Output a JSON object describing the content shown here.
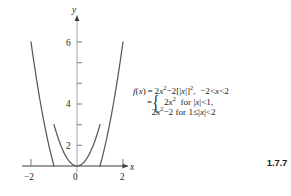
{
  "figure": {
    "number": "1.7.7",
    "axes": {
      "x_label": "x",
      "y_label": "y",
      "origin_label": "0",
      "x_ticks_labeled": [
        "-2",
        "2"
      ],
      "y_ticks_labeled": [
        "2",
        "4",
        "6"
      ]
    },
    "formula": {
      "line1": {
        "lhs": "f(x)",
        "eq": "=",
        "rhs_a": "2x",
        "rhs_a_exp": "2",
        "minus": "−2[[x]]",
        "minus_exp": "2",
        "comma": ",",
        "domain": "−2 < x < 2"
      },
      "line2": {
        "eq": "=",
        "brace": "{",
        "expr": "2x",
        "expr_exp": "2",
        "for": "for",
        "cond": "|x| < 1,"
      },
      "line3": {
        "expr": "2x",
        "expr_exp": "2",
        "expr_tail": "−2",
        "for": "for",
        "cond": "1 ≤ |x| < 2"
      }
    }
  },
  "chart_data": {
    "type": "line",
    "title": "",
    "xlabel": "x",
    "ylabel": "y",
    "xlim": [
      -2.45,
      2.45
    ],
    "ylim": [
      -0.6,
      6.9
    ],
    "xticks": [
      -2,
      -1,
      1,
      2
    ],
    "xtick_labels": [
      "-2",
      "",
      "",
      "2"
    ],
    "yticks": [
      1,
      2,
      3,
      4,
      5,
      6
    ],
    "ytick_labels": [
      "",
      "2",
      "",
      "4",
      "",
      "6"
    ],
    "grid": false,
    "legend": null,
    "series": [
      {
        "name": "2x^2 for |x| < 1",
        "domain": [
          -1,
          1
        ],
        "x": [
          -1.0,
          -0.9,
          -0.8,
          -0.7,
          -0.6,
          -0.5,
          -0.4,
          -0.3,
          -0.2,
          -0.1,
          0.0,
          0.1,
          0.2,
          0.3,
          0.4,
          0.5,
          0.6,
          0.7,
          0.8,
          0.9,
          1.0
        ],
        "y": [
          2.0,
          1.62,
          1.28,
          0.98,
          0.72,
          0.5,
          0.32,
          0.18,
          0.08,
          0.02,
          0.0,
          0.02,
          0.08,
          0.18,
          0.32,
          0.5,
          0.72,
          0.98,
          1.28,
          1.62,
          2.0
        ]
      },
      {
        "name": "2x^2-2 for 1 <= x < 2",
        "domain": [
          1,
          2
        ],
        "x": [
          1.0,
          1.1,
          1.2,
          1.3,
          1.4,
          1.5,
          1.6,
          1.7,
          1.8,
          1.9,
          2.0
        ],
        "y": [
          0.0,
          0.42,
          0.88,
          1.38,
          1.92,
          2.5,
          3.12,
          3.78,
          4.48,
          5.22,
          6.0
        ]
      },
      {
        "name": "2x^2-2 for -2 < x <= -1",
        "domain": [
          -2,
          -1
        ],
        "x": [
          -2.0,
          -1.9,
          -1.8,
          -1.7,
          -1.6,
          -1.5,
          -1.4,
          -1.3,
          -1.2,
          -1.1,
          -1.0
        ],
        "y": [
          6.0,
          5.22,
          4.48,
          3.78,
          3.12,
          2.5,
          1.92,
          1.38,
          0.88,
          0.42,
          0.0
        ]
      }
    ],
    "annotations": [
      "f(x) = 2x^2 - 2[[x]]^2,  -2 < x < 2",
      "= 2x^2 for |x| < 1,",
      "= 2x^2 - 2 for 1 <= |x| < 2"
    ]
  }
}
